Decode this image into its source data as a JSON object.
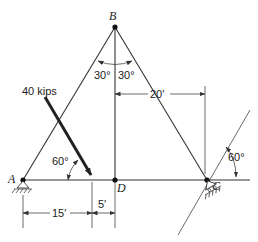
{
  "figure": {
    "type": "truss-diagram",
    "nodes": [
      {
        "id": "A",
        "label": "A",
        "x": 23,
        "y": 180,
        "support": "pin"
      },
      {
        "id": "B",
        "label": "B",
        "x": 115,
        "y": 27,
        "support": "none"
      },
      {
        "id": "C",
        "label": "C",
        "x": 207,
        "y": 180,
        "support": "roller-on-incline"
      },
      {
        "id": "D",
        "label": "D",
        "x": 115,
        "y": 180,
        "support": "none"
      }
    ],
    "members": [
      [
        "A",
        "B"
      ],
      [
        "B",
        "C"
      ],
      [
        "B",
        "D"
      ],
      [
        "A",
        "D"
      ],
      [
        "D",
        "C"
      ]
    ],
    "load": {
      "label": "40 kips",
      "angle_label": "60°"
    },
    "angles": {
      "B_left": "30°",
      "B_right": "30°",
      "C_incline": "60°"
    },
    "dimensions": {
      "A_to_load": "15′",
      "load_to_D": "5′",
      "D_to_C": "20′"
    }
  }
}
